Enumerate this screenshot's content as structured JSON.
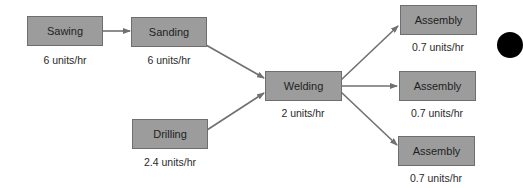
{
  "diagram": {
    "type": "process-flow",
    "nodes": [
      {
        "id": "sawing",
        "label": "Sawing",
        "rate": "6 units/hr"
      },
      {
        "id": "sanding",
        "label": "Sanding",
        "rate": "6 units/hr"
      },
      {
        "id": "drilling",
        "label": "Drilling",
        "rate": "2.4 units/hr"
      },
      {
        "id": "welding",
        "label": "Welding",
        "rate": "2 units/hr"
      },
      {
        "id": "assembly1",
        "label": "Assembly",
        "rate": "0.7 units/hr"
      },
      {
        "id": "assembly2",
        "label": "Assembly",
        "rate": "0.7 units/hr"
      },
      {
        "id": "assembly3",
        "label": "Assembly",
        "rate": "0.7 units/hr"
      }
    ],
    "edges": [
      {
        "from": "sawing",
        "to": "sanding"
      },
      {
        "from": "sanding",
        "to": "welding"
      },
      {
        "from": "drilling",
        "to": "welding"
      },
      {
        "from": "welding",
        "to": "assembly1"
      },
      {
        "from": "welding",
        "to": "assembly2"
      },
      {
        "from": "welding",
        "to": "assembly3"
      }
    ],
    "colors": {
      "box_fill": "#9c9c9c",
      "box_border": "#6e6e6e",
      "arrow": "#707070",
      "text": "#1e1e1e"
    }
  }
}
